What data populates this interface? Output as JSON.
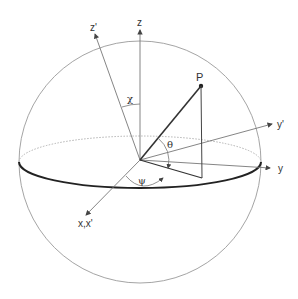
{
  "labels": {
    "z": "z",
    "z_prime": "z'",
    "y": "y",
    "y_prime": "y'",
    "x": "x,x'",
    "point": "P",
    "chi": "χ",
    "theta": "θ",
    "psi": "ψ"
  },
  "colors": {
    "sphere": "#9a9a9a",
    "equator_front": "#222222",
    "equator_back": "#aaaaaa",
    "axes": "#777777",
    "vector": "#333333"
  }
}
